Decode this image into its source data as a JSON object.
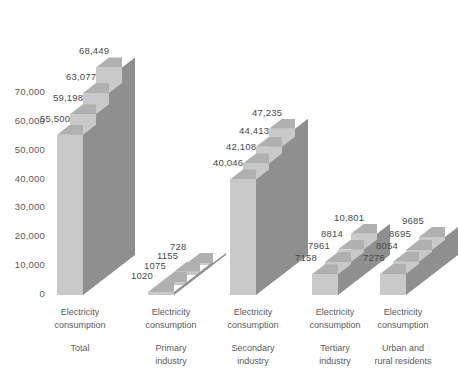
{
  "chart_data": {
    "type": "bar",
    "title": "",
    "subtitle": "",
    "xlabel": "",
    "ylabel": "",
    "ylim": [
      0,
      70000
    ],
    "ytick_values": [
      0,
      10000,
      20000,
      30000,
      40000,
      50000,
      60000,
      70000
    ],
    "ytick_labels": [
      "0",
      "10,000",
      "20,000",
      "30,000",
      "40,000",
      "50,000",
      "60,000",
      "70,000"
    ],
    "grid": false,
    "legend": "none",
    "style": "3d-clustered-column",
    "background": "#ffffff",
    "bar_face_color": "#c9c9c9",
    "bar_side_color": "#8f8f8f",
    "bar_top_color": "#b0b0b0",
    "categories": [
      "Electricity consumption Total",
      "Electricity consumption Primary industry",
      "Electricity consumption Secondary industry",
      "Electricity consumption Tertiary industry",
      "Electricity consumption Urban and rural residents"
    ],
    "category_lines": [
      {
        "line1": "Electricity",
        "line2": "consumption",
        "line3": "Total"
      },
      {
        "line1": "Electricity",
        "line2": "consumption",
        "line3": "Primary"
      },
      {
        "line1": "Electricity",
        "line2": "consumption",
        "line3": "Secondary"
      },
      {
        "line1": "Electricity",
        "line2": "consumption",
        "line3": "Tertiary"
      },
      {
        "line1": "Electricity",
        "line2": "consumption",
        "line3": "Urban and"
      }
    ],
    "series": [
      {
        "name": "Series 1",
        "values": [
          55500,
          1020,
          40046,
          7158,
          7276
        ]
      },
      {
        "name": "Series 2",
        "values": [
          59198,
          1075,
          42108,
          7961,
          8054
        ]
      },
      {
        "name": "Series 3",
        "values": [
          63077,
          1155,
          44413,
          8814,
          8695
        ]
      },
      {
        "name": "Series 4",
        "values": [
          68449,
          728,
          47235,
          10801,
          9685
        ]
      }
    ],
    "groups": [
      {
        "label_line1": "Electricity",
        "label_line2": "consumption",
        "label_line3": "Total",
        "label_line4": "",
        "bars": [
          {
            "value": 55500,
            "label": "55,500"
          },
          {
            "value": 59198,
            "label": "59,198"
          },
          {
            "value": 63077,
            "label": "63,077"
          },
          {
            "value": 68449,
            "label": "68,449"
          }
        ]
      },
      {
        "label_line1": "Electricity",
        "label_line2": "consumption",
        "label_line3": "Primary",
        "label_line4": "industry",
        "bars": [
          {
            "value": 1020,
            "label": "1020"
          },
          {
            "value": 1075,
            "label": "1075"
          },
          {
            "value": 1155,
            "label": "1155"
          },
          {
            "value": 728,
            "label": "728"
          }
        ]
      },
      {
        "label_line1": "Electricity",
        "label_line2": "consumption",
        "label_line3": "Secondary",
        "label_line4": "industry",
        "bars": [
          {
            "value": 40046,
            "label": "40,046"
          },
          {
            "value": 42108,
            "label": "42,108"
          },
          {
            "value": 44413,
            "label": "44,413"
          },
          {
            "value": 47235,
            "label": "47,235"
          }
        ]
      },
      {
        "label_line1": "Electricity",
        "label_line2": "consumption",
        "label_line3": "Tertiary",
        "label_line4": "industry",
        "bars": [
          {
            "value": 7158,
            "label": "7158"
          },
          {
            "value": 7961,
            "label": "7961"
          },
          {
            "value": 8814,
            "label": "8814"
          },
          {
            "value": 10801,
            "label": "10,801"
          }
        ]
      },
      {
        "label_line1": "Electricity",
        "label_line2": "consumption",
        "label_line3": "Urban and",
        "label_line4": "rural residents",
        "bars": [
          {
            "value": 7276,
            "label": "7276"
          },
          {
            "value": 8054,
            "label": "8054"
          },
          {
            "value": 8695,
            "label": "8695"
          },
          {
            "value": 9685,
            "label": "9685"
          }
        ]
      }
    ]
  }
}
